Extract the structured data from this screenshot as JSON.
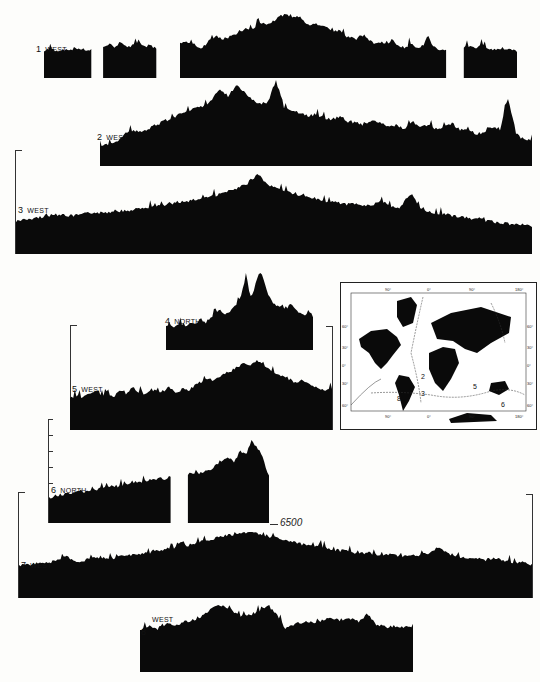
{
  "chart_data": {
    "type": "area",
    "title": "",
    "depth_reference_label": "6500",
    "profiles": [
      {
        "id": 1,
        "number": "1",
        "direction": "WEST",
        "label": "1 WEST",
        "heights": [
          10,
          12,
          9,
          11,
          10,
          12,
          13,
          10,
          11,
          0,
          14,
          20,
          15,
          22,
          13,
          18,
          24,
          14,
          18,
          12,
          0,
          0,
          0,
          18,
          22,
          20,
          14,
          16,
          24,
          30,
          26,
          28,
          30,
          36,
          40,
          38,
          44,
          48,
          46,
          52,
          58,
          60,
          54,
          58,
          50,
          46,
          48,
          44,
          40,
          36,
          38,
          30,
          28,
          26,
          32,
          24,
          20,
          22,
          18,
          26,
          16,
          14,
          20,
          14,
          16,
          30,
          14,
          12,
          10,
          0,
          0,
          14,
          16,
          12,
          18,
          14,
          12,
          10,
          12,
          11,
          10
        ]
      },
      {
        "id": 2,
        "number": "2",
        "direction": "WEST",
        "label": "2 WEST",
        "heights": [
          6,
          8,
          10,
          20,
          24,
          22,
          26,
          30,
          34,
          38,
          42,
          46,
          48,
          52,
          58,
          70,
          62,
          74,
          66,
          58,
          54,
          56,
          80,
          50,
          46,
          44,
          40,
          42,
          38,
          36,
          40,
          34,
          32,
          30,
          36,
          32,
          28,
          30,
          26,
          34,
          28,
          30,
          26,
          28,
          32,
          24,
          26,
          20,
          22,
          28,
          24,
          60,
          20,
          14,
          12
        ]
      },
      {
        "id": 3,
        "number": "3",
        "direction": "WEST",
        "label": "3 WEST",
        "heights": [
          18,
          20,
          22,
          24,
          26,
          24,
          26,
          28,
          28,
          30,
          30,
          32,
          34,
          36,
          38,
          40,
          42,
          46,
          48,
          52,
          56,
          62,
          74,
          60,
          56,
          52,
          48,
          46,
          42,
          40,
          38,
          38,
          36,
          40,
          36,
          34,
          50,
          30,
          28,
          26,
          24,
          22,
          20,
          18,
          16,
          14,
          14,
          12
        ]
      },
      {
        "id": 4,
        "number": "4",
        "direction": "NORTH",
        "label": "4 NORTH",
        "heights": [
          14,
          16,
          14,
          18,
          16,
          18,
          20,
          18,
          22,
          20,
          24,
          30,
          34,
          28,
          30,
          36,
          40,
          52,
          74,
          44,
          60,
          78,
          66,
          50,
          42,
          38,
          36,
          34,
          40,
          34,
          30,
          28,
          32,
          26
        ]
      },
      {
        "id": 5,
        "number": "5",
        "direction": "WEST",
        "label": "5 WEST",
        "heights": [
          20,
          24,
          22,
          26,
          30,
          24,
          28,
          22,
          30,
          26,
          34,
          28,
          26,
          32,
          28,
          30,
          34,
          28,
          32,
          30,
          36,
          40,
          44,
          42,
          46,
          52,
          54,
          58,
          62,
          60,
          66,
          58,
          54,
          50,
          48,
          44,
          40,
          42,
          38,
          34,
          32,
          30,
          32
        ]
      },
      {
        "id": 6,
        "number": "6",
        "direction": "NORTH",
        "label": "6 NORTH",
        "heights": [
          20,
          22,
          22,
          24,
          24,
          26,
          26,
          28,
          28,
          30,
          30,
          32,
          32,
          34,
          34,
          36,
          36,
          38,
          38,
          40,
          40,
          42,
          0,
          0,
          44,
          46,
          46,
          48,
          50,
          54,
          58,
          62,
          56,
          70,
          64,
          80,
          72,
          60,
          42
        ]
      },
      {
        "id": 7,
        "number": "7",
        "direction": "WEST",
        "label": "7 WEST",
        "heights": [
          14,
          16,
          18,
          20,
          28,
          18,
          24,
          26,
          24,
          28,
          30,
          32,
          34,
          38,
          40,
          44,
          48,
          52,
          56,
          58,
          60,
          56,
          52,
          48,
          44,
          42,
          40,
          36,
          34,
          30,
          32,
          28,
          30,
          26,
          28,
          30,
          40,
          28,
          26,
          24,
          22,
          24,
          20,
          18,
          16
        ]
      },
      {
        "id": 8,
        "number": "8",
        "direction": "WEST",
        "label": "8 WEST",
        "heights": [
          18,
          24,
          20,
          28,
          24,
          30,
          32,
          38,
          48,
          52,
          46,
          36,
          38,
          44,
          50,
          40,
          20,
          26,
          30,
          28,
          32,
          36,
          30,
          34,
          30,
          40,
          26,
          22,
          24,
          22,
          24
        ]
      }
    ],
    "map": {
      "type": "world map, Mercator",
      "top_ticks": [
        "90°",
        "0°",
        "90°",
        "180°"
      ],
      "bottom_ticks": [
        "90°",
        "0°",
        "90°",
        "180°"
      ],
      "left_ticks": [
        "60°",
        "30°",
        "0°",
        "30°",
        "60°"
      ],
      "right_ticks": [
        "60°",
        "30°",
        "0°",
        "30°",
        "60°"
      ],
      "track_labels": [
        "2",
        "3",
        "5",
        "6",
        "8"
      ]
    }
  },
  "colors": {
    "ink": "#0a0a0a",
    "paper": "#fdfdfb"
  }
}
